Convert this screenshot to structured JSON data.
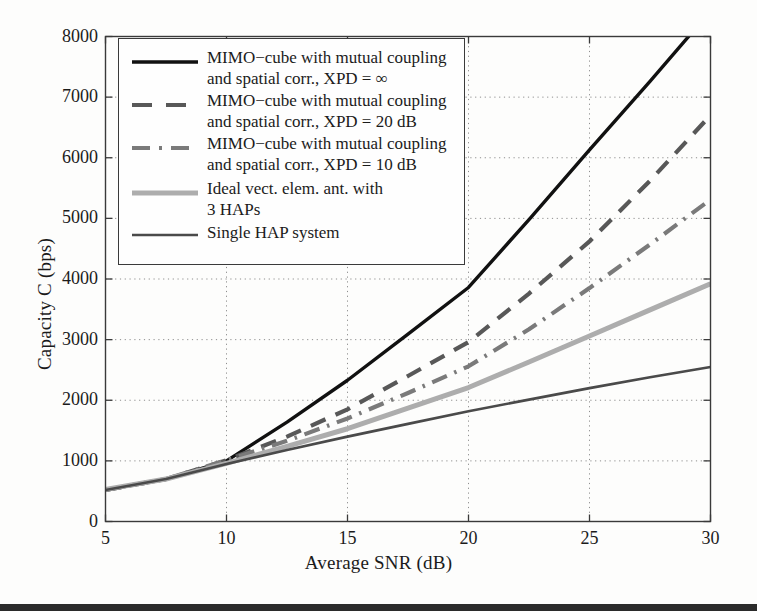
{
  "figure": {
    "background_color": "#fdfdfc",
    "frame_color": "#3a3a3a",
    "bottom_bar_color": "#2b2b2b"
  },
  "chart_data": {
    "type": "line",
    "title": "",
    "xlabel": "Average SNR (dB)",
    "ylabel": "Capacity C (bps)",
    "xlim": [
      5,
      30
    ],
    "ylim": [
      0,
      8000
    ],
    "xticks": [
      5,
      10,
      15,
      20,
      25,
      30
    ],
    "yticks": [
      0,
      1000,
      2000,
      3000,
      4000,
      5000,
      6000,
      7000,
      8000
    ],
    "xtick_labels": [
      "5",
      "10",
      "15",
      "20",
      "25",
      "30"
    ],
    "ytick_labels": [
      "0",
      "1000",
      "2000",
      "3000",
      "4000",
      "5000",
      "6000",
      "7000",
      "8000"
    ],
    "grid": true,
    "grid_style": "dotted",
    "legend_position": "upper-left",
    "x": [
      5,
      7.5,
      10,
      12.5,
      15,
      17.5,
      20,
      22.5,
      25,
      27.5,
      30
    ],
    "series": [
      {
        "name": "MIMO-cube with mutual coupling\nand spatial corr., XPD = ∞",
        "color": "#111111",
        "style": "solid",
        "width": 3.4,
        "values": [
          520,
          700,
          1000,
          1640,
          2330,
          3090,
          3860,
          4980,
          6130,
          7260,
          8420
        ]
      },
      {
        "name": "MIMO-cube with mutual coupling\nand spatial corr., XPD = 20 dB",
        "color": "#585858",
        "style": "dashed",
        "width": 4.2,
        "values": [
          520,
          700,
          1010,
          1400,
          1850,
          2400,
          2960,
          3760,
          4620,
          5620,
          6700
        ]
      },
      {
        "name": "MIMO-cube with mutual coupling\nand spatial corr., XPD = 10 dB",
        "color": "#7a7a7a",
        "style": "dashdot",
        "width": 4.2,
        "values": [
          520,
          700,
          1010,
          1330,
          1700,
          2120,
          2560,
          3170,
          3850,
          4570,
          5310
        ]
      },
      {
        "name": "Ideal vect. elem. ant. with\n3 HAPs",
        "color": "#adadad",
        "style": "solid",
        "width": 5.0,
        "values": [
          530,
          700,
          960,
          1240,
          1530,
          1870,
          2210,
          2630,
          3060,
          3490,
          3920
        ]
      },
      {
        "name": "Single HAP system",
        "color": "#4a4a4a",
        "style": "solid",
        "width": 2.6,
        "values": [
          520,
          700,
          950,
          1180,
          1400,
          1610,
          1820,
          2010,
          2200,
          2380,
          2550
        ]
      }
    ]
  },
  "legend": {
    "items": [
      {
        "label": "MIMO−cube with mutual coupling\nand spatial corr., XPD = ∞",
        "swatch": "line-solid-black"
      },
      {
        "label": "MIMO−cube with mutual coupling\nand spatial corr., XPD = 20 dB",
        "swatch": "line-dashed-darkgray"
      },
      {
        "label": "MIMO−cube with mutual coupling\nand spatial corr., XPD = 10 dB",
        "swatch": "line-dashdot-gray"
      },
      {
        "label": "Ideal vect. elem. ant. with\n3 HAPs",
        "swatch": "line-solid-lightgray"
      },
      {
        "label": "Single HAP system",
        "swatch": "line-solid-dark"
      }
    ]
  }
}
